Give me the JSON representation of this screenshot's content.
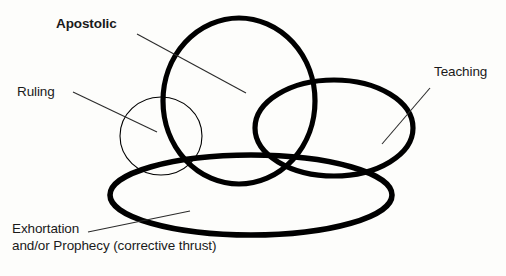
{
  "diagram": {
    "background_color": "#fdfdfb",
    "stroke_color": "#000000",
    "text_color": "#1a1a1a",
    "shapes": [
      {
        "name": "apostolic-circle",
        "kind": "circle",
        "label_ref": "apostolic",
        "cx": 239,
        "cy": 101,
        "rx": 76,
        "ry": 83,
        "stroke_width": 5.2
      },
      {
        "name": "ruling-circle",
        "kind": "circle",
        "label_ref": "ruling",
        "cx": 161,
        "cy": 136,
        "rx": 41,
        "ry": 39,
        "stroke_width": 1.1
      },
      {
        "name": "teaching-ellipse",
        "kind": "ellipse",
        "label_ref": "teaching",
        "cx": 334,
        "cy": 128,
        "rx": 79,
        "ry": 48,
        "stroke_width": 5.2
      },
      {
        "name": "exhortation-ellipse",
        "kind": "ellipse",
        "label_ref": "exhortation",
        "cx": 251,
        "cy": 195,
        "rx": 141,
        "ry": 40,
        "stroke_width": 5.6
      }
    ],
    "labels": [
      {
        "id": "apostolic",
        "text": "Apostolic",
        "bold": true,
        "leader": {
          "x1": 137,
          "y1": 34,
          "x2": 246,
          "y2": 93
        }
      },
      {
        "id": "ruling",
        "text": "Ruling",
        "bold": false,
        "leader": {
          "x1": 73,
          "y1": 92,
          "x2": 157,
          "y2": 132
        }
      },
      {
        "id": "teaching",
        "text": "Teaching",
        "bold": false,
        "leader": {
          "x1": 430,
          "y1": 88,
          "x2": 382,
          "y2": 144
        }
      },
      {
        "id": "exhortation",
        "text_line_1": "Exhortation",
        "text_line_2": "and/or Prophecy (corrective thrust)",
        "bold": false,
        "leader": {
          "x1": 88,
          "y1": 232,
          "x2": 190,
          "y2": 211
        }
      }
    ],
    "leader_stroke_width": 1.1
  }
}
